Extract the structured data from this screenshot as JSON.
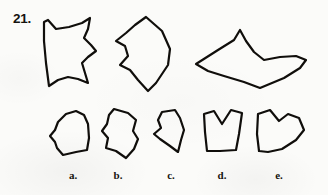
{
  "page": {
    "question_number": "21.",
    "background_color": "#fbfbf9",
    "ink_color": "#100e0b",
    "kind": "multiple-choice-shape-puzzle"
  },
  "prompt_row": {
    "name": "prompt-shapes",
    "shapes": [
      {
        "id": "prompt-shape-1",
        "semantic_name": "prompt-shape-quadrilateral-scalloped",
        "description": "tall quadrilateral with concave scalloped top, right and bottom edges",
        "x": 38,
        "y": 13,
        "width": 68,
        "height": 80,
        "stroke_width": 2.2,
        "path": "M 6 9 L 10 7 L 18 16 L 31 14 L 44 10 L 52 5 L 50 16 L 46 25 L 53 32 L 58 38 L 50 44 L 44 50 L 47 60 L 50 70 L 40 66 L 30 64 L 20 67 L 11 73 L 8 50 L 6 28 Z"
      },
      {
        "id": "prompt-shape-2",
        "semantic_name": "prompt-shape-kite-concave-left",
        "description": "kite shape with concave scalloped left edge and pointed bottom",
        "x": 108,
        "y": 13,
        "width": 72,
        "height": 80,
        "stroke_width": 2.2,
        "path": "M 38 4 L 54 18 L 62 36 L 60 52 L 48 70 L 40 78 L 30 67 L 22 57 L 12 52 L 20 43 L 17 33 L 8 28 L 18 20 L 27 12 Z"
      },
      {
        "id": "prompt-shape-3",
        "semantic_name": "prompt-shape-bird-wing",
        "description": "wide bird or bat-like shape with a deep V notch at the top center and a swept right wing",
        "x": 188,
        "y": 24,
        "width": 132,
        "height": 66,
        "stroke_width": 2.2,
        "path": "M 8 40 L 30 26 L 46 16 L 52 6 L 58 17 L 66 28 L 76 36 L 92 33 L 108 32 L 118 36 L 112 44 L 96 54 L 72 64 L 56 58 L 36 52 L 20 47 Z"
      }
    ]
  },
  "choice_row": {
    "name": "answer-choices",
    "choices": [
      {
        "id": "choice-a",
        "label": "a.",
        "semantic_name": "answer-choice-a",
        "description": "rounded-top polygon with small notch on the left edge",
        "x": 46,
        "y": 106,
        "width": 52,
        "height": 56,
        "label_x": 62,
        "label_y": 169,
        "stroke_width": 2.2,
        "path": "M 12 16 L 20 8 L 30 5 L 38 9 L 42 18 L 43 32 L 41 44 L 30 46 L 17 49 L 11 42 L 9 36 L 4 30 L 9 24 Z"
      },
      {
        "id": "choice-b",
        "label": "b.",
        "semantic_name": "answer-choice-b",
        "description": "quadrilateral with concave left edge and notched bottom",
        "x": 94,
        "y": 104,
        "width": 54,
        "height": 58,
        "label_x": 107,
        "label_y": 169,
        "stroke_width": 2.2,
        "path": "M 20 5 L 34 9 L 42 16 L 39 27 L 44 35 L 40 45 L 32 54 L 22 47 L 12 44 L 14 34 L 8 27 L 13 20 L 15 11 Z"
      },
      {
        "id": "choice-c",
        "label": "c.",
        "semantic_name": "answer-choice-c",
        "description": "narrow tall shape with concave left edge and pointed bottom",
        "x": 148,
        "y": 106,
        "width": 46,
        "height": 56,
        "label_x": 160,
        "label_y": 169,
        "stroke_width": 2.2,
        "path": "M 14 6 L 27 4 L 32 12 L 36 24 L 33 34 L 30 46 L 22 40 L 12 33 L 6 28 L 13 22 L 10 14 Z"
      },
      {
        "id": "choice-d",
        "label": "d.",
        "semantic_name": "answer-choice-d",
        "description": "box shape with a deep rounded V notch cut into the top edge",
        "x": 198,
        "y": 106,
        "width": 50,
        "height": 54,
        "label_x": 211,
        "label_y": 169,
        "stroke_width": 2.2,
        "path": "M 6 8 L 16 5 L 24 18 L 33 4 L 44 7 L 41 28 L 38 44 L 22 45 L 9 45 L 7 26 Z"
      },
      {
        "id": "choice-e",
        "label": "e.",
        "semantic_name": "answer-choice-e",
        "description": "heart or arrowhead shape with a V notch top and a point on the right",
        "x": 252,
        "y": 104,
        "width": 58,
        "height": 56,
        "label_x": 268,
        "label_y": 169,
        "stroke_width": 2.2,
        "path": "M 6 10 L 18 6 L 27 17 L 36 10 L 47 14 L 52 26 L 44 36 L 30 45 L 16 48 L 7 47 L 5 30 Z"
      }
    ]
  }
}
